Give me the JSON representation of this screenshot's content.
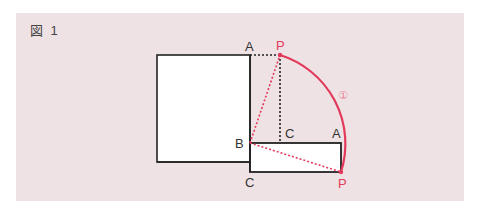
{
  "figure": {
    "label": "図 1"
  },
  "colors": {
    "background_panel": "#efe2e4",
    "line_black": "#222222",
    "accent_red": "#e23a5a",
    "label_gray": "#444444"
  },
  "points": {
    "A_top": "A",
    "P_top": "P",
    "B": "B",
    "C_inner": "C",
    "A_right": "A",
    "C_bottom": "C",
    "P_bottom": "P",
    "arc_marker": "①"
  }
}
